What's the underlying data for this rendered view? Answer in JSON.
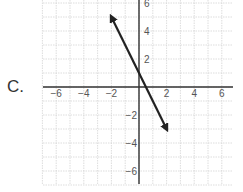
{
  "option_label": "C.",
  "chart_data": {
    "type": "line",
    "title": "",
    "xlabel": "",
    "ylabel": "",
    "xlim": [
      -7,
      7
    ],
    "ylim": [
      -7,
      6.3
    ],
    "grid": true,
    "grid_step": 1,
    "x_ticks": [
      -6,
      -4,
      -2,
      2,
      4,
      6
    ],
    "y_ticks": [
      6,
      4,
      2,
      -2,
      -4,
      -6
    ],
    "x_tick_labels": [
      "−6",
      "−4",
      "−2",
      "2",
      "4",
      "6"
    ],
    "y_tick_labels": [
      "6",
      "4",
      "2",
      "−2",
      "−4",
      "−6"
    ],
    "series": [
      {
        "name": "line",
        "equation": "y = -2x + 1",
        "slope": -2,
        "intercept": 1,
        "x": [
          -2,
          2
        ],
        "y": [
          5,
          -3
        ],
        "arrows": "both ends",
        "color": "#222222"
      }
    ]
  }
}
